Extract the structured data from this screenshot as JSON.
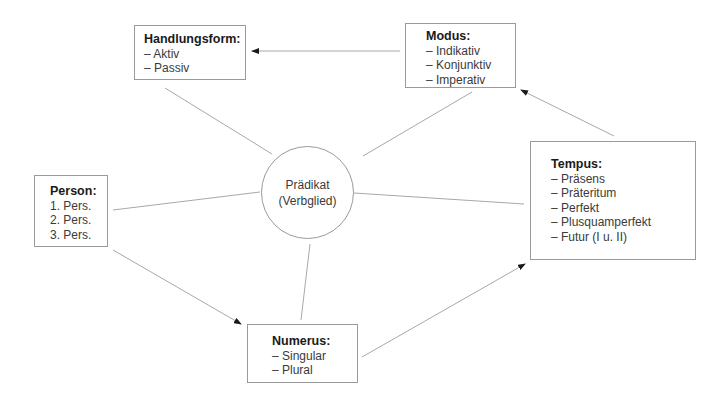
{
  "diagram": {
    "center": {
      "line1": "Prädikat",
      "line2": "(Verbglied)"
    },
    "nodes": {
      "handlungsform": {
        "title": "Handlungsform:",
        "items": [
          "– Aktiv",
          "– Passiv"
        ]
      },
      "modus": {
        "title": "Modus:",
        "items": [
          "– Indikativ",
          "– Konjunktiv",
          "– Imperativ"
        ]
      },
      "tempus": {
        "title": "Tempus:",
        "items": [
          "– Präsens",
          "– Präteritum",
          "– Perfekt",
          "– Plusquamperfekt",
          "– Futur (I u. II)"
        ]
      },
      "person": {
        "title": "Person:",
        "items": [
          "1. Pers.",
          "2. Pers.",
          "3. Pers."
        ]
      },
      "numerus": {
        "title": "Numerus:",
        "items": [
          "– Singular",
          "– Plural"
        ]
      }
    },
    "edges": [
      {
        "from": "center",
        "to": "handlungsform",
        "arrow": false
      },
      {
        "from": "center",
        "to": "modus",
        "arrow": false
      },
      {
        "from": "center",
        "to": "tempus",
        "arrow": false
      },
      {
        "from": "center",
        "to": "person",
        "arrow": false
      },
      {
        "from": "center",
        "to": "numerus",
        "arrow": false
      },
      {
        "from": "modus",
        "to": "handlungsform",
        "arrow": true
      },
      {
        "from": "tempus",
        "to": "modus",
        "arrow": true
      },
      {
        "from": "person",
        "to": "numerus",
        "arrow": true
      },
      {
        "from": "numerus",
        "to": "tempus",
        "arrow": true
      }
    ],
    "colors": {
      "line": "#9a9a9a",
      "arrowhead": "#1a1a1a",
      "text": "#2a2a2a"
    }
  }
}
